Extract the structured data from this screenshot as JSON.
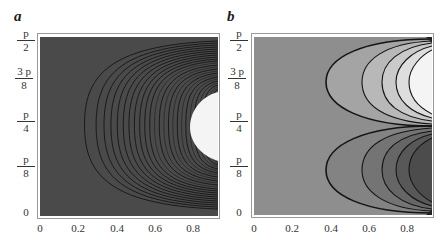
{
  "figure": {
    "panels": [
      {
        "label": "a"
      },
      {
        "label": "b"
      }
    ]
  },
  "chart_data": [
    {
      "type": "heatmap",
      "panel": "a",
      "title": "",
      "xlabel": "",
      "ylabel": "",
      "xlim": [
        0,
        0.92
      ],
      "ylim": [
        0,
        1.5708
      ],
      "x_ticks": [
        "0",
        "0.2",
        "0.4",
        "0.6",
        "0.8"
      ],
      "y_ticks": [
        {
          "num": "0",
          "den": ""
        },
        {
          "num": "p",
          "den": "8"
        },
        {
          "num": "p",
          "den": "4"
        },
        {
          "num": "3 p",
          "den": "8"
        },
        {
          "num": "p",
          "den": "2"
        }
      ],
      "description": "Contour plot with dark gray background; ~25 densely spaced nested C-shaped contour lines opening to the right, leftmost vertex near x=0.23 at y≈π/4, converging toward the right edge; white region near x=0.9, y≈π/4.",
      "contour_vertex_x_range": [
        0.23,
        0.88
      ],
      "contour_count_approx": 25,
      "background_color": "#4a4a4a",
      "line_color": "#111111",
      "highlight_color": "#f2f2f2",
      "grid": false,
      "legend": null
    },
    {
      "type": "heatmap",
      "panel": "b",
      "title": "",
      "xlabel": "",
      "ylabel": "",
      "xlim": [
        0,
        0.92
      ],
      "ylim": [
        0,
        1.5708
      ],
      "x_ticks": [
        "0",
        "0.2",
        "0.4",
        "0.6",
        "0.8"
      ],
      "y_ticks": [
        {
          "num": "0",
          "den": ""
        },
        {
          "num": "p",
          "den": "8"
        },
        {
          "num": "p",
          "den": "4"
        },
        {
          "num": "3 p",
          "den": "8"
        },
        {
          "num": "p",
          "den": "2"
        }
      ],
      "description": "Contour plot, medium gray background; two families of 5 nested C-shaped contours opening to the right: upper family centered near y≈3π/8 shading to white, lower family centered near y≈π/8 shading to dark gray. Contours pinch at (0.92, 0), (0.92, π/4), (0.92, π/2).",
      "upper_family": {
        "center_y": "3p/8",
        "vertex_x": [
          0.3,
          0.5,
          0.6,
          0.67,
          0.73
        ],
        "fill_trend": "lighter"
      },
      "lower_family": {
        "center_y": "p/8",
        "vertex_x": [
          0.3,
          0.5,
          0.6,
          0.67,
          0.73
        ],
        "fill_trend": "darker"
      },
      "background_color": "#8e8e8e",
      "line_color": "#111111",
      "grid": false,
      "legend": null
    }
  ]
}
